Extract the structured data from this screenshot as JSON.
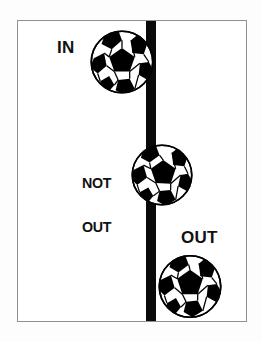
{
  "figure": {
    "panel": {
      "background_color": "#ffffff",
      "border_color": "#8d9094"
    },
    "boundary_line": {
      "name": "touchline",
      "color": "#0a0a0a",
      "orientation": "vertical",
      "width_px": 10
    },
    "labels": [
      {
        "id": "in",
        "text": "IN"
      },
      {
        "id": "not_out",
        "line1": "NOT",
        "line2": "OUT"
      },
      {
        "id": "out",
        "text": "OUT"
      }
    ],
    "balls": [
      {
        "id": "ball-in",
        "label": "IN",
        "position": "fully inside the line"
      },
      {
        "id": "ball-not-out",
        "label": "NOT OUT",
        "position": "overlapping the line"
      },
      {
        "id": "ball-out",
        "label": "OUT",
        "position": "fully beyond the line"
      }
    ],
    "colors": {
      "ink": "#111111",
      "line": "#0a0a0a",
      "frame": "#8d9094",
      "paper": "#ffffff"
    }
  }
}
